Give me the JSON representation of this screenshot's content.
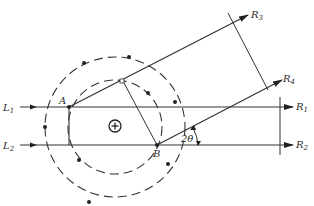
{
  "diagram": {
    "labels": {
      "L1": "L",
      "L1_sub": "1",
      "L2": "L",
      "L2_sub": "2",
      "A": "A",
      "B": "B",
      "R1": "R",
      "R1_sub": "1",
      "R2": "R",
      "R2_sub": "2",
      "R3": "R",
      "R3_sub": "3",
      "R4": "R",
      "R4_sub": "4",
      "angle": "2θ",
      "center_symbol": "+"
    },
    "colors": {
      "line": "#333333",
      "background": "#ffffff"
    }
  }
}
